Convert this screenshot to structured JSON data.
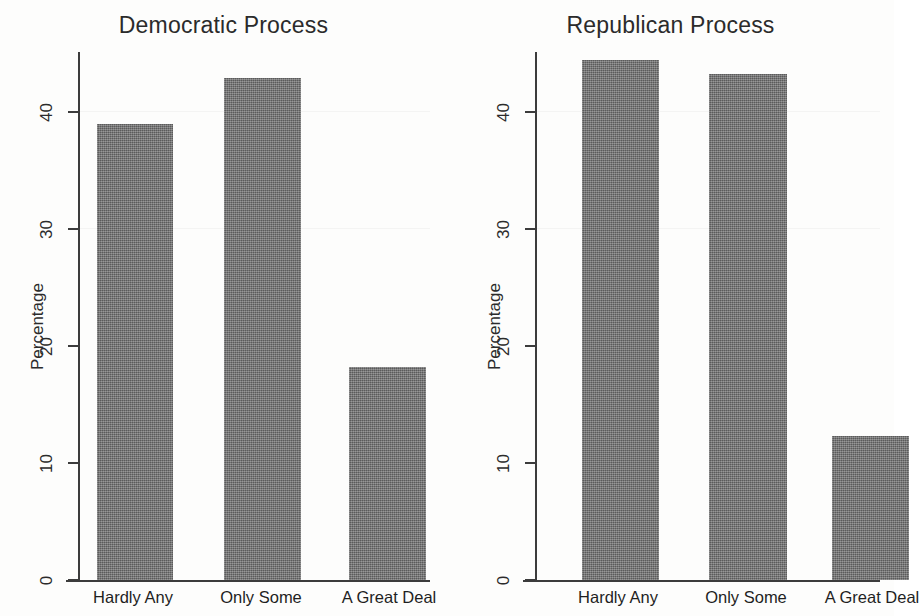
{
  "figure": {
    "width": 894,
    "height": 616,
    "background": "#fdfdfc",
    "bar_color": "#6f6f6f",
    "axis_color": "#3c3c3c"
  },
  "chart_data": [
    {
      "type": "bar",
      "title": "Democratic Process",
      "xlabel": "",
      "ylabel": "Percentage",
      "categories": [
        "Hardly Any",
        "Only Some",
        "A Great Deal"
      ],
      "values": [
        38.9,
        42.8,
        18.2
      ],
      "ylim": [
        0,
        45
      ],
      "yticks": [
        0,
        10,
        20,
        30,
        40
      ],
      "ytick_labels": [
        "0",
        "10",
        "20",
        "30",
        "40"
      ],
      "grid": false,
      "legend": "none",
      "orientation": "vertical"
    },
    {
      "type": "bar",
      "title": "Republican Process",
      "xlabel": "",
      "ylabel": "Percentage",
      "categories": [
        "Hardly Any",
        "Only Some",
        "A Great Deal"
      ],
      "values": [
        44.3,
        43.1,
        12.3
      ],
      "ylim": [
        0,
        45
      ],
      "yticks": [
        0,
        10,
        20,
        30,
        40
      ],
      "ytick_labels": [
        "0",
        "10",
        "20",
        "30",
        "40"
      ],
      "grid": false,
      "legend": "none",
      "orientation": "vertical"
    }
  ]
}
